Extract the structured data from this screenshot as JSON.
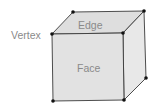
{
  "diagram": {
    "type": "cube",
    "labels": {
      "vertex": "Vertex",
      "edge": "Edge",
      "face": "Face"
    },
    "colors": {
      "front_face": "#e2e2e2",
      "top_face": "#dedede",
      "side_face": "#e8e8e8",
      "edge": "#3a3a3a",
      "vertex": "#111111",
      "label": "#8a8a8a"
    },
    "vertices": [
      {
        "name": "front-top-left",
        "x": 52,
        "y": 34
      },
      {
        "name": "front-top-right",
        "x": 123,
        "y": 33
      },
      {
        "name": "front-bottom-left",
        "x": 53,
        "y": 101
      },
      {
        "name": "front-bottom-right",
        "x": 124,
        "y": 100
      },
      {
        "name": "back-top-left",
        "x": 73,
        "y": 12
      },
      {
        "name": "back-top-right",
        "x": 144,
        "y": 11
      },
      {
        "name": "back-bottom-right",
        "x": 146,
        "y": 78
      }
    ]
  }
}
